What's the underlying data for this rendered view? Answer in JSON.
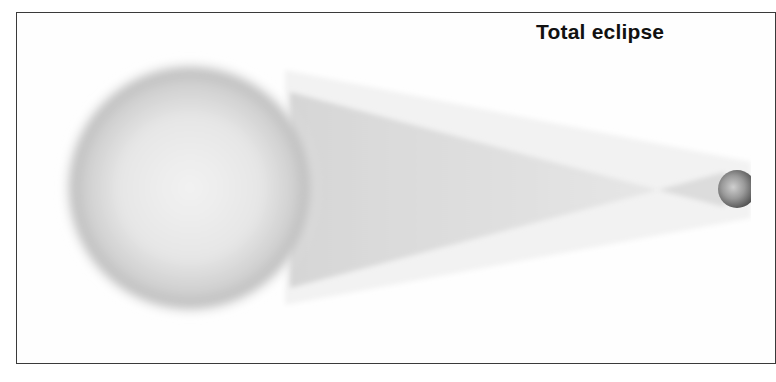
{
  "title": "Total eclipse",
  "diagram": {
    "type": "solar-eclipse-geometry",
    "bodies": [
      {
        "name": "Sun",
        "label": "sun",
        "cx": 190,
        "cy": 188,
        "r": 126
      },
      {
        "name": "Moon",
        "label": "moon",
        "cx": 737,
        "cy": 189,
        "r": 19
      }
    ],
    "shadow_regions": [
      "umbra-cone",
      "penumbra-band"
    ],
    "colors": {
      "frame": "#3a3a3a",
      "sun_edge": "#9a9a9a",
      "sun_center": "#ececec",
      "umbra": "#e2e2e2",
      "penumbra": "#f1f1f1",
      "moon_dark": "#5a5a5a",
      "moon_light": "#c8c8c8"
    }
  }
}
